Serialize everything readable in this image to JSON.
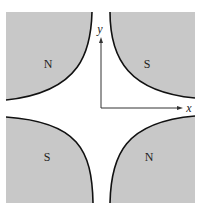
{
  "diagram": {
    "type": "quadrupole-magnet",
    "fill_color": "#c8c8c8",
    "line_color": "#111111",
    "poles": [
      {
        "position": "top-left",
        "label": "N"
      },
      {
        "position": "top-right",
        "label": "S"
      },
      {
        "position": "bottom-left",
        "label": "S"
      },
      {
        "position": "bottom-right",
        "label": "N"
      }
    ],
    "axes": {
      "x_label": "x",
      "y_label": "y"
    }
  }
}
